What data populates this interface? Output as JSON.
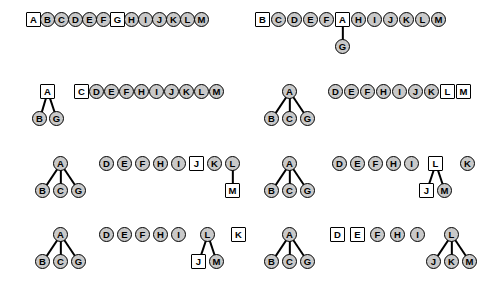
{
  "figure": {
    "node_labels": [
      "A",
      "B",
      "C",
      "D",
      "E",
      "F",
      "G",
      "H",
      "I",
      "J",
      "K",
      "L",
      "M"
    ],
    "shapes": {
      "circle": "circle-node",
      "square": "square-node"
    },
    "colors": {
      "background": "#ffffff",
      "circle_fill": "#c9c9c9",
      "square_fill": "#ffffff",
      "stroke": "#000000",
      "label": "#000000"
    },
    "node_diameter_px": 15,
    "panel_count": 8
  },
  "panels": [
    {
      "id": "panel-1",
      "position": "row1-left",
      "origin": {
        "x": 26,
        "y": 12
      },
      "nodes": [
        {
          "label": "A",
          "shape": "square",
          "x": 0,
          "y": 0
        },
        {
          "label": "B",
          "shape": "circle",
          "x": 14,
          "y": 0
        },
        {
          "label": "C",
          "shape": "circle",
          "x": 28,
          "y": 0
        },
        {
          "label": "D",
          "shape": "circle",
          "x": 42,
          "y": 0
        },
        {
          "label": "E",
          "shape": "circle",
          "x": 56,
          "y": 0
        },
        {
          "label": "F",
          "shape": "circle",
          "x": 70,
          "y": 0
        },
        {
          "label": "G",
          "shape": "square",
          "x": 84,
          "y": 0
        },
        {
          "label": "H",
          "shape": "circle",
          "x": 98,
          "y": 0
        },
        {
          "label": "I",
          "shape": "circle",
          "x": 112,
          "y": 0
        },
        {
          "label": "J",
          "shape": "circle",
          "x": 126,
          "y": 0
        },
        {
          "label": "K",
          "shape": "circle",
          "x": 140,
          "y": 0
        },
        {
          "label": "L",
          "shape": "circle",
          "x": 154,
          "y": 0
        },
        {
          "label": "M",
          "shape": "circle",
          "x": 168,
          "y": 0
        }
      ],
      "edges": []
    },
    {
      "id": "panel-2",
      "position": "row1-right",
      "origin": {
        "x": 255,
        "y": 12
      },
      "nodes": [
        {
          "label": "B",
          "shape": "square",
          "x": 0,
          "y": 0
        },
        {
          "label": "C",
          "shape": "circle",
          "x": 16,
          "y": 0
        },
        {
          "label": "D",
          "shape": "circle",
          "x": 32,
          "y": 0
        },
        {
          "label": "E",
          "shape": "circle",
          "x": 48,
          "y": 0
        },
        {
          "label": "F",
          "shape": "circle",
          "x": 64,
          "y": 0
        },
        {
          "label": "A",
          "shape": "square",
          "x": 80,
          "y": 0
        },
        {
          "label": "H",
          "shape": "circle",
          "x": 96,
          "y": 0
        },
        {
          "label": "I",
          "shape": "circle",
          "x": 112,
          "y": 0
        },
        {
          "label": "J",
          "shape": "circle",
          "x": 128,
          "y": 0
        },
        {
          "label": "K",
          "shape": "circle",
          "x": 144,
          "y": 0
        },
        {
          "label": "L",
          "shape": "circle",
          "x": 160,
          "y": 0
        },
        {
          "label": "M",
          "shape": "circle",
          "x": 176,
          "y": 0
        },
        {
          "label": "G",
          "shape": "circle",
          "x": 80,
          "y": 27
        }
      ],
      "edges": [
        {
          "from": "A",
          "to": "G"
        }
      ]
    },
    {
      "id": "panel-3",
      "position": "row2-left",
      "origin": {
        "x": 35,
        "y": 84
      },
      "nodes": [
        {
          "label": "A",
          "shape": "square",
          "x": 5,
          "y": 0
        },
        {
          "label": "B",
          "shape": "circle",
          "x": -3,
          "y": 27
        },
        {
          "label": "G",
          "shape": "circle",
          "x": 14,
          "y": 27
        },
        {
          "label": "C",
          "shape": "square",
          "x": 39,
          "y": 0
        },
        {
          "label": "D",
          "shape": "circle",
          "x": 54,
          "y": 0
        },
        {
          "label": "E",
          "shape": "circle",
          "x": 69,
          "y": 0
        },
        {
          "label": "F",
          "shape": "circle",
          "x": 84,
          "y": 0
        },
        {
          "label": "H",
          "shape": "circle",
          "x": 99,
          "y": 0
        },
        {
          "label": "I",
          "shape": "circle",
          "x": 114,
          "y": 0
        },
        {
          "label": "J",
          "shape": "circle",
          "x": 129,
          "y": 0
        },
        {
          "label": "K",
          "shape": "circle",
          "x": 144,
          "y": 0
        },
        {
          "label": "L",
          "shape": "circle",
          "x": 159,
          "y": 0
        },
        {
          "label": "M",
          "shape": "circle",
          "x": 174,
          "y": 0
        }
      ],
      "edges": [
        {
          "from": "A",
          "to": "B"
        },
        {
          "from": "A",
          "to": "G"
        }
      ]
    },
    {
      "id": "panel-4",
      "position": "row2-right",
      "origin": {
        "x": 264,
        "y": 84
      },
      "nodes": [
        {
          "label": "A",
          "shape": "circle",
          "x": 18,
          "y": 0
        },
        {
          "label": "B",
          "shape": "circle",
          "x": 0,
          "y": 27
        },
        {
          "label": "C",
          "shape": "circle",
          "x": 18,
          "y": 27
        },
        {
          "label": "G",
          "shape": "circle",
          "x": 36,
          "y": 27
        },
        {
          "label": "D",
          "shape": "circle",
          "x": 64,
          "y": 0
        },
        {
          "label": "E",
          "shape": "circle",
          "x": 80,
          "y": 0
        },
        {
          "label": "F",
          "shape": "circle",
          "x": 96,
          "y": 0
        },
        {
          "label": "H",
          "shape": "circle",
          "x": 112,
          "y": 0
        },
        {
          "label": "I",
          "shape": "circle",
          "x": 128,
          "y": 0
        },
        {
          "label": "J",
          "shape": "circle",
          "x": 144,
          "y": 0
        },
        {
          "label": "K",
          "shape": "circle",
          "x": 160,
          "y": 0
        },
        {
          "label": "L",
          "shape": "square",
          "x": 176,
          "y": 0
        },
        {
          "label": "M",
          "shape": "square",
          "x": 192,
          "y": 0
        }
      ],
      "edges": [
        {
          "from": "A",
          "to": "B"
        },
        {
          "from": "A",
          "to": "C"
        },
        {
          "from": "A",
          "to": "G"
        }
      ]
    },
    {
      "id": "panel-5",
      "position": "row3-left",
      "origin": {
        "x": 35,
        "y": 156
      },
      "nodes": [
        {
          "label": "A",
          "shape": "circle",
          "x": 18,
          "y": 0
        },
        {
          "label": "B",
          "shape": "circle",
          "x": 0,
          "y": 27
        },
        {
          "label": "C",
          "shape": "circle",
          "x": 18,
          "y": 27
        },
        {
          "label": "G",
          "shape": "circle",
          "x": 36,
          "y": 27
        },
        {
          "label": "D",
          "shape": "circle",
          "x": 64,
          "y": 0
        },
        {
          "label": "E",
          "shape": "circle",
          "x": 82,
          "y": 0
        },
        {
          "label": "F",
          "shape": "circle",
          "x": 100,
          "y": 0
        },
        {
          "label": "H",
          "shape": "circle",
          "x": 118,
          "y": 0
        },
        {
          "label": "I",
          "shape": "circle",
          "x": 136,
          "y": 0
        },
        {
          "label": "J",
          "shape": "square",
          "x": 154,
          "y": 0
        },
        {
          "label": "K",
          "shape": "circle",
          "x": 172,
          "y": 0
        },
        {
          "label": "L",
          "shape": "circle",
          "x": 190,
          "y": 0
        },
        {
          "label": "M",
          "shape": "square",
          "x": 190,
          "y": 27
        }
      ],
      "edges": [
        {
          "from": "A",
          "to": "B"
        },
        {
          "from": "A",
          "to": "C"
        },
        {
          "from": "A",
          "to": "G"
        },
        {
          "from": "L",
          "to": "M"
        }
      ]
    },
    {
      "id": "panel-6",
      "position": "row3-right",
      "origin": {
        "x": 264,
        "y": 156
      },
      "nodes": [
        {
          "label": "A",
          "shape": "circle",
          "x": 18,
          "y": 0
        },
        {
          "label": "B",
          "shape": "circle",
          "x": 0,
          "y": 27
        },
        {
          "label": "C",
          "shape": "circle",
          "x": 18,
          "y": 27
        },
        {
          "label": "G",
          "shape": "circle",
          "x": 36,
          "y": 27
        },
        {
          "label": "D",
          "shape": "circle",
          "x": 68,
          "y": 0
        },
        {
          "label": "E",
          "shape": "circle",
          "x": 86,
          "y": 0
        },
        {
          "label": "F",
          "shape": "circle",
          "x": 104,
          "y": 0
        },
        {
          "label": "H",
          "shape": "circle",
          "x": 122,
          "y": 0
        },
        {
          "label": "I",
          "shape": "circle",
          "x": 140,
          "y": 0
        },
        {
          "label": "L",
          "shape": "square",
          "x": 164,
          "y": 0
        },
        {
          "label": "K",
          "shape": "circle",
          "x": 196,
          "y": 0
        },
        {
          "label": "J",
          "shape": "square",
          "x": 155,
          "y": 27
        },
        {
          "label": "M",
          "shape": "circle",
          "x": 173,
          "y": 27
        }
      ],
      "edges": [
        {
          "from": "A",
          "to": "B"
        },
        {
          "from": "A",
          "to": "C"
        },
        {
          "from": "A",
          "to": "G"
        },
        {
          "from": "L",
          "to": "J"
        },
        {
          "from": "L",
          "to": "M"
        }
      ]
    },
    {
      "id": "panel-7",
      "position": "row4-left",
      "origin": {
        "x": 35,
        "y": 227
      },
      "nodes": [
        {
          "label": "A",
          "shape": "circle",
          "x": 18,
          "y": 0
        },
        {
          "label": "B",
          "shape": "circle",
          "x": 0,
          "y": 27
        },
        {
          "label": "C",
          "shape": "circle",
          "x": 18,
          "y": 27
        },
        {
          "label": "G",
          "shape": "circle",
          "x": 36,
          "y": 27
        },
        {
          "label": "D",
          "shape": "circle",
          "x": 64,
          "y": 0
        },
        {
          "label": "E",
          "shape": "circle",
          "x": 82,
          "y": 0
        },
        {
          "label": "F",
          "shape": "circle",
          "x": 100,
          "y": 0
        },
        {
          "label": "H",
          "shape": "circle",
          "x": 118,
          "y": 0
        },
        {
          "label": "I",
          "shape": "circle",
          "x": 136,
          "y": 0
        },
        {
          "label": "L",
          "shape": "circle",
          "x": 165,
          "y": 0
        },
        {
          "label": "K",
          "shape": "square",
          "x": 196,
          "y": 0
        },
        {
          "label": "J",
          "shape": "square",
          "x": 156,
          "y": 27
        },
        {
          "label": "M",
          "shape": "circle",
          "x": 174,
          "y": 27
        }
      ],
      "edges": [
        {
          "from": "A",
          "to": "B"
        },
        {
          "from": "A",
          "to": "C"
        },
        {
          "from": "A",
          "to": "G"
        },
        {
          "from": "L",
          "to": "J"
        },
        {
          "from": "L",
          "to": "M"
        }
      ]
    },
    {
      "id": "panel-8",
      "position": "row4-right",
      "origin": {
        "x": 264,
        "y": 227
      },
      "nodes": [
        {
          "label": "A",
          "shape": "circle",
          "x": 18,
          "y": 0
        },
        {
          "label": "B",
          "shape": "circle",
          "x": 0,
          "y": 27
        },
        {
          "label": "C",
          "shape": "circle",
          "x": 18,
          "y": 27
        },
        {
          "label": "G",
          "shape": "circle",
          "x": 36,
          "y": 27
        },
        {
          "label": "D",
          "shape": "square",
          "x": 66,
          "y": 0
        },
        {
          "label": "E",
          "shape": "square",
          "x": 86,
          "y": 0
        },
        {
          "label": "F",
          "shape": "circle",
          "x": 106,
          "y": 0
        },
        {
          "label": "H",
          "shape": "circle",
          "x": 126,
          "y": 0
        },
        {
          "label": "I",
          "shape": "circle",
          "x": 146,
          "y": 0
        },
        {
          "label": "L",
          "shape": "circle",
          "x": 180,
          "y": 0
        },
        {
          "label": "J",
          "shape": "circle",
          "x": 162,
          "y": 27
        },
        {
          "label": "K",
          "shape": "circle",
          "x": 180,
          "y": 27
        },
        {
          "label": "M",
          "shape": "circle",
          "x": 198,
          "y": 27
        }
      ],
      "edges": [
        {
          "from": "A",
          "to": "B"
        },
        {
          "from": "A",
          "to": "C"
        },
        {
          "from": "A",
          "to": "G"
        },
        {
          "from": "L",
          "to": "J"
        },
        {
          "from": "L",
          "to": "K"
        },
        {
          "from": "L",
          "to": "M"
        }
      ]
    }
  ]
}
